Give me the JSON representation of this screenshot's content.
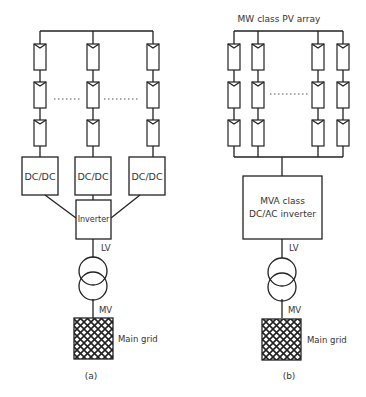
{
  "panel_a": {
    "converters": [
      "DC/DC",
      "DC/DC",
      "DC/DC"
    ],
    "inverter_label": "Inverter",
    "lv_label": "LV",
    "mv_label": "MV",
    "grid_label": "Main grid",
    "caption": "(a)"
  },
  "panel_b": {
    "title": "MW class PV array",
    "inverter_line1": "MVA class",
    "inverter_line2": "DC/AC inverter",
    "lv_label": "LV",
    "mv_label": "MV",
    "grid_label": "Main grid",
    "caption": "(b)"
  },
  "colors": {
    "stroke": "#222222",
    "text": "#333333",
    "background": "#ffffff"
  }
}
